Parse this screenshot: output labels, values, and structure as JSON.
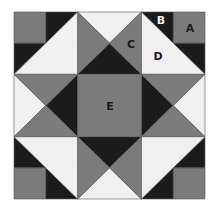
{
  "diagram": {
    "type": "quilt-block",
    "grid": "3x3",
    "colors": {
      "gray": "#7b7b7b",
      "black": "#1b1b1b",
      "white": "#f0f0f0",
      "outline": "#555555"
    },
    "labels": {
      "A": "A",
      "B": "B",
      "C": "C",
      "D": "D",
      "E": "E"
    },
    "pieces": [
      {
        "label": "A",
        "description": "corner square",
        "color": "gray"
      },
      {
        "label": "B",
        "description": "small corner triangle",
        "color": "black"
      },
      {
        "label": "C",
        "description": "quarter-square triangle",
        "color": "gray"
      },
      {
        "label": "D",
        "description": "half-square triangle",
        "color": "white"
      },
      {
        "label": "E",
        "description": "center square",
        "color": "gray"
      }
    ]
  }
}
